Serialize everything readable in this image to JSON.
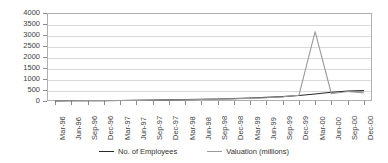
{
  "chart_data": {
    "type": "line",
    "title": "",
    "xlabel": "",
    "ylabel": "",
    "ylim": [
      0,
      4000
    ],
    "yticks": [
      0,
      500,
      1000,
      1500,
      2000,
      2500,
      3000,
      3500,
      4000
    ],
    "grid": true,
    "legend_position": "bottom",
    "categories": [
      "Mar-96",
      "Jun-96",
      "Sep-96",
      "Dec-96",
      "Mar-97",
      "Jun-97",
      "Sep-97",
      "Dec-97",
      "Mar-98",
      "Jun-98",
      "Sep-98",
      "Dec-98",
      "Mar-99",
      "Jun-99",
      "Sep-99",
      "Dec-99",
      "Mar-00",
      "Jun-00",
      "Sep-00",
      "Dec-00"
    ],
    "series": [
      {
        "name": "No. of Employees",
        "color": "#2b2b2b",
        "values": [
          5,
          8,
          12,
          18,
          25,
          32,
          40,
          50,
          62,
          75,
          90,
          110,
          135,
          165,
          200,
          250,
          320,
          400,
          450,
          470
        ]
      },
      {
        "name": "Valuation (millions)",
        "color": "#9a9a9a",
        "values": [
          10,
          12,
          15,
          20,
          25,
          30,
          35,
          45,
          55,
          70,
          85,
          100,
          120,
          150,
          190,
          260,
          3150,
          330,
          430,
          370
        ]
      }
    ]
  },
  "legend": {
    "items": [
      {
        "label": "No. of Employees",
        "color": "#2b2b2b"
      },
      {
        "label": "Valuation (millions)",
        "color": "#9a9a9a"
      }
    ]
  }
}
